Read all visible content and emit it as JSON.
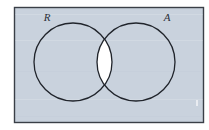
{
  "figure": {
    "kind": "venn-diagram",
    "caption": "",
    "background_color": "#ffffff",
    "frame": {
      "stroke_color": "#3a3f47",
      "fill_color": "#c9d2dd",
      "x": 14.5,
      "y": 7.5,
      "width": 189,
      "height": 115,
      "stroke_width": 1.4
    },
    "shading": {
      "shaded_region_name": "intersection",
      "shaded_region_color": "#ffffff",
      "unshaded_region_color": "#c9d2dd",
      "description": "The lens-shaped overlap of the two circles is white; the rest of the universal set rectangle is shaded."
    },
    "circles": [
      {
        "label": "R",
        "name": "circle-r",
        "cx": 73,
        "cy": 62,
        "r": 39,
        "stroke_color": "#20242b",
        "stroke_width": 1.3,
        "label_x": 47,
        "label_y": 21
      },
      {
        "label": "A",
        "name": "circle-a",
        "cx": 136,
        "cy": 62,
        "r": 39,
        "stroke_color": "#20242b",
        "stroke_width": 1.3,
        "label_x": 167,
        "label_y": 21
      }
    ],
    "artifact": {
      "name": "scan-speck",
      "x": 196,
      "y": 100,
      "width": 2,
      "height": 6,
      "color": "#eef1f5"
    }
  }
}
